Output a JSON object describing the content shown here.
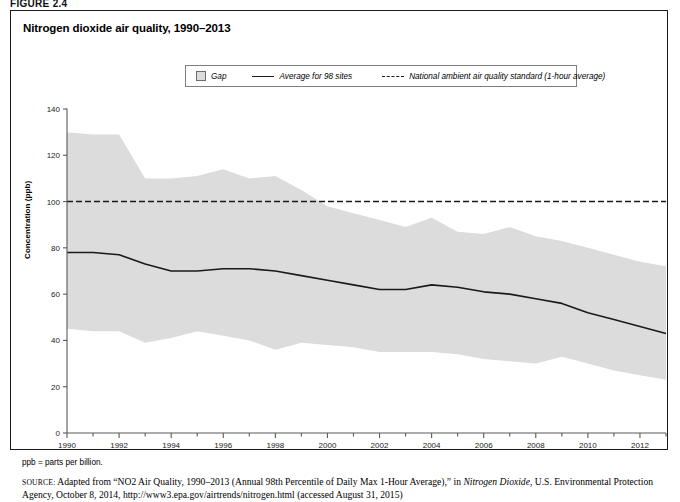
{
  "figure": {
    "label": "FIGURE 2.4",
    "title": "Nitrogen dioxide air quality, 1990–2013"
  },
  "legend": {
    "items": [
      {
        "name": "gap",
        "label": "Gap",
        "marker": "filled-square-swatch",
        "color": "#dcdcdc"
      },
      {
        "name": "average",
        "label": "Average for 98 sites",
        "marker": "solid-line",
        "color": "#1a1a1a"
      },
      {
        "name": "standard",
        "label": "National ambient air quality standard (1-hour average)",
        "marker": "dashed-line",
        "color": "#1a1a1a"
      }
    ]
  },
  "notes": {
    "ppb": "ppb = parts per billion.",
    "source_label": "SOURCE:",
    "source_text_1": " Adapted from “NO2 Air Quality, 1990–2013 (Annual 98th Percentile of Daily Max 1-Hour Average),” in ",
    "source_italic": "Nitrogen Dioxide",
    "source_text_2": ", U.S. Environmental Protection Agency, October 8, 2014, http://www3.epa.gov/airtrends/nitrogen.html (accessed August 31, 2015)"
  },
  "chart_data": {
    "type": "area",
    "title": "Nitrogen dioxide air quality, 1990–2013",
    "xlabel": "",
    "ylabel": "Concentration (ppb)",
    "xlim": [
      1990,
      2013
    ],
    "ylim": [
      0,
      140
    ],
    "yticks": [
      0,
      20,
      40,
      60,
      80,
      100,
      120,
      140
    ],
    "xticks": [
      1990,
      1992,
      1994,
      1996,
      1998,
      2000,
      2002,
      2004,
      2006,
      2008,
      2010,
      2012
    ],
    "x_minor_ticks_every": 1,
    "grid": false,
    "legend_position": "top-right",
    "x": [
      1990,
      1991,
      1992,
      1993,
      1994,
      1995,
      1996,
      1997,
      1998,
      1999,
      2000,
      2001,
      2002,
      2003,
      2004,
      2005,
      2006,
      2007,
      2008,
      2009,
      2010,
      2011,
      2012,
      2013
    ],
    "series": [
      {
        "name": "Gap upper bound",
        "type": "area-upper",
        "values": [
          130,
          129,
          129,
          110,
          110,
          111,
          114,
          110,
          111,
          105,
          98,
          95,
          92,
          89,
          93,
          87,
          86,
          89,
          85,
          83,
          80,
          77,
          74,
          72
        ]
      },
      {
        "name": "Gap lower bound",
        "type": "area-lower",
        "values": [
          45,
          44,
          44,
          39,
          41,
          44,
          42,
          40,
          36,
          39,
          38,
          37,
          35,
          35,
          35,
          34,
          32,
          31,
          30,
          33,
          30,
          27,
          25,
          23
        ]
      },
      {
        "name": "Average for 98 sites",
        "type": "line",
        "values": [
          78,
          78,
          77,
          73,
          70,
          70,
          71,
          71,
          70,
          68,
          66,
          64,
          62,
          62,
          64,
          63,
          61,
          60,
          58,
          56,
          52,
          49,
          46,
          43
        ]
      },
      {
        "name": "National ambient air quality standard (1-hour average)",
        "type": "hline",
        "value": 100
      }
    ]
  }
}
